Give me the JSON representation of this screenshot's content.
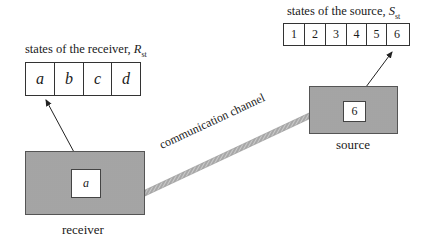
{
  "receiver": {
    "caption_text": "states of the receiver, ",
    "caption_symbol": "R",
    "caption_sub": "st",
    "states": [
      "a",
      "b",
      "c",
      "d"
    ],
    "current_state": "a",
    "label": "receiver"
  },
  "source": {
    "caption_text": "states of the source, ",
    "caption_symbol": "S",
    "caption_sub": "st",
    "states": [
      "1",
      "2",
      "3",
      "4",
      "5",
      "6"
    ],
    "current_state": "6",
    "label": "source"
  },
  "channel": {
    "label": "communication channel"
  },
  "colors": {
    "shaded_fill": "#b9b9b9",
    "line": "#333333",
    "channel": "#9a9a9a"
  }
}
